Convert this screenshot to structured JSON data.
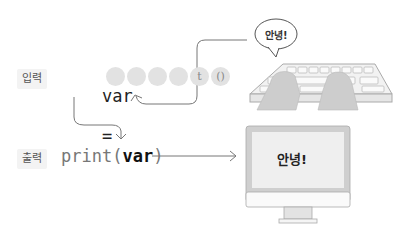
{
  "diagram": {
    "title": "",
    "input_row": {
      "label": "입력",
      "code_var": "var",
      "code_eq": "=",
      "function_circles": [
        "i",
        "n",
        "p",
        "u",
        "t",
        "()"
      ],
      "hidden_circles_count": 4
    },
    "output_row": {
      "label": "출력",
      "code_prefix": "print(",
      "code_arg": "var",
      "code_suffix": ")"
    },
    "speech_bubble": {
      "text": "안녕!"
    },
    "monitor": {
      "screen_text": "안녕!"
    },
    "colors": {
      "line": "#777777",
      "circle_fill": "#e2e2e2",
      "label_bg": "#f3f3f3",
      "device_gray": "#cfcfcf",
      "screen_bg": "#efefef"
    }
  }
}
